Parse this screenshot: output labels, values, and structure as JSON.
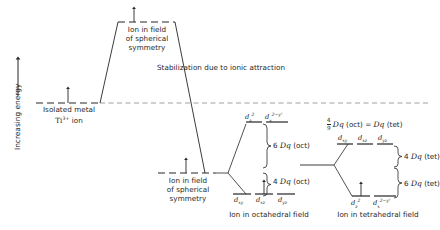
{
  "diagram": {
    "y_axis_label": "Increasing energy",
    "labels": {
      "isolated_metal_line1": "Isolated metal",
      "isolated_metal_line2_pre": "Ti",
      "isolated_metal_charge": "3+",
      "isolated_metal_line2_post": "ion",
      "spherical_top_l1": "Ion in field",
      "spherical_top_l2": "of spherical",
      "spherical_top_l3": "symmetry",
      "spherical_mid_l1": "Ion in field",
      "spherical_mid_l2": "of spherical",
      "spherical_mid_l3": "symmetry",
      "stabilization": "Stabilization due to ionic attraction",
      "octahedral_caption": "Ion in octahedral field",
      "tetrahedral_caption": "Ion in tetrahedral field"
    },
    "octahedral": {
      "upper_orbitals": [
        {
          "base": "d",
          "sub": "z",
          "sup": "2"
        },
        {
          "base": "d",
          "sub": "x",
          "sup": "2−y²"
        }
      ],
      "lower_orbitals": [
        {
          "base": "d",
          "sub": "xy"
        },
        {
          "base": "d",
          "sub": "xz"
        },
        {
          "base": "d",
          "sub": "yz"
        }
      ],
      "upper_split_value": "6",
      "upper_split_unit": "Dq",
      "upper_split_field": "(oct)",
      "lower_split_value": "4",
      "lower_split_unit": "Dq",
      "lower_split_field": "(oct)",
      "electron_on": "d_xz"
    },
    "tetrahedral": {
      "relation_numerator": "4",
      "relation_denominator": "9",
      "relation_unit_a": "Dq",
      "relation_field_a": "(oct)",
      "relation_equals": "=",
      "relation_unit_b": "Dq",
      "relation_field_b": "(tet)",
      "upper_orbitals": [
        {
          "base": "d",
          "sub": "xy"
        },
        {
          "base": "d",
          "sub": "xz"
        },
        {
          "base": "d",
          "sub": "yz"
        }
      ],
      "lower_orbitals": [
        {
          "base": "d",
          "sub": "z",
          "sup": "2"
        },
        {
          "base": "d",
          "sub": "x",
          "sup": "2−y²"
        }
      ],
      "upper_split_value": "4",
      "upper_split_unit": "Dq",
      "upper_split_field": "(tet)",
      "lower_split_value": "6",
      "lower_split_unit": "Dq",
      "lower_split_field": "(tet)",
      "electron_on": "d_z2"
    },
    "colors": {
      "line": "#262626",
      "dashed": "#555555",
      "background": "#ffffff"
    }
  }
}
